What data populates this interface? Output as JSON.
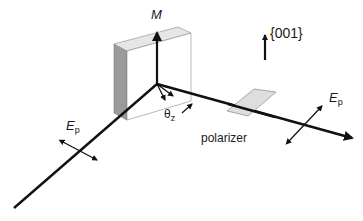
{
  "figure": {
    "labels": {
      "magnetization": "M",
      "crystal_axis": "{001}",
      "incident_field": {
        "symbol": "E",
        "subscript": "p"
      },
      "transmitted_field": {
        "symbol": "E",
        "subscript": "p"
      },
      "rotation_angle": {
        "symbol": "θ",
        "subscript": "z"
      },
      "polarizer": "polarizer"
    },
    "colors": {
      "line": "#111111",
      "sample_face": "#ffffff",
      "sample_top": "#e6e6e6",
      "sample_side": "#9a9a9a",
      "polarizer_fill": "#dedede",
      "outline": "#888888"
    }
  }
}
